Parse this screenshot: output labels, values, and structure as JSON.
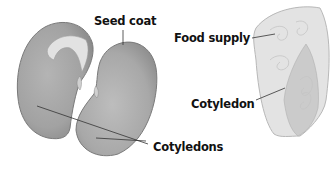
{
  "diagram": {
    "bean_seed": {
      "labels": {
        "seed_coat": "Seed coat",
        "cotyledons": "Cotyledons"
      }
    },
    "corn_seed": {
      "labels": {
        "food_supply": "Food supply",
        "cotyledon": "Cotyledon"
      }
    }
  }
}
